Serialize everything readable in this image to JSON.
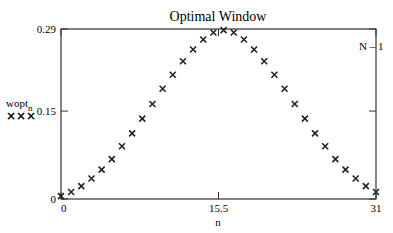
{
  "chart_data": {
    "type": "scatter",
    "title": "Optimal Window",
    "xlabel": "n",
    "ylabel": "wopt_n",
    "ylabel_base": "wopt",
    "ylabel_sub": "n",
    "legend": {
      "marker": "×××",
      "series_name": "wopt_n",
      "position": "left"
    },
    "xlim": [
      0,
      31
    ],
    "ylim": [
      0,
      0.29
    ],
    "x_ticks": [
      "0",
      "15.5",
      "31"
    ],
    "y_ticks": [
      "0",
      "0.15",
      "0.29"
    ],
    "x_tick_values": [
      0,
      15.5,
      31
    ],
    "y_tick_values": [
      0,
      0.15,
      0.29
    ],
    "right_marker_label": "N – 1",
    "grid": false,
    "series": [
      {
        "name": "wopt_n",
        "marker": "x",
        "x": [
          0,
          1,
          2,
          3,
          4,
          5,
          6,
          7,
          8,
          9,
          10,
          11,
          12,
          13,
          14,
          15,
          16,
          17,
          18,
          19,
          20,
          21,
          22,
          23,
          24,
          25,
          26,
          27,
          28,
          29,
          30,
          31
        ],
        "values": [
          0.005,
          0.012,
          0.022,
          0.035,
          0.05,
          0.068,
          0.09,
          0.112,
          0.137,
          0.162,
          0.188,
          0.212,
          0.235,
          0.255,
          0.272,
          0.284,
          0.288,
          0.284,
          0.272,
          0.255,
          0.235,
          0.212,
          0.188,
          0.162,
          0.137,
          0.112,
          0.09,
          0.068,
          0.05,
          0.035,
          0.022,
          0.012
        ]
      }
    ]
  }
}
